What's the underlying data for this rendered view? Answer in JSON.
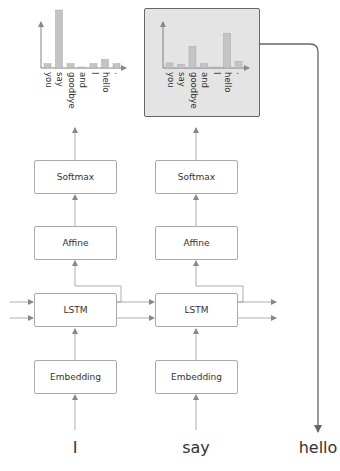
{
  "diagram": {
    "title": "",
    "columns": [
      {
        "input_word": "I",
        "layers": [
          "Embedding",
          "LSTM",
          "Affine",
          "Softmax"
        ],
        "highlighted": false
      },
      {
        "input_word": "say",
        "layers": [
          "Embedding",
          "LSTM",
          "Affine",
          "Softmax"
        ],
        "highlighted": true
      }
    ],
    "sampled_output_word": "hello",
    "layer_labels": {
      "softmax": "Softmax",
      "affine": "Affine",
      "lstm": "LSTM",
      "embedding": "Embedding"
    },
    "words": {
      "col1": "I",
      "col2": "say",
      "output": "hello"
    },
    "colors": {
      "bar": "#c4c4c4",
      "bar_border": "#a8a8a8",
      "highlight_bg": "#e4e4e4",
      "highlight_border": "#666666",
      "line": "#888888"
    }
  },
  "chart_data": [
    {
      "type": "bar",
      "title": "",
      "categories": [
        "you",
        "say",
        "goodbye",
        "and",
        "I",
        "hello",
        "."
      ],
      "values": [
        0.06,
        0.8,
        0.06,
        0.01,
        0.06,
        0.12,
        0.06
      ],
      "xlabel": "",
      "ylabel": "",
      "ylim": [
        0,
        1
      ],
      "orientation": "vertical",
      "label_rotation": 90
    },
    {
      "type": "bar",
      "title": "",
      "categories": [
        "you",
        "say",
        "goodbye",
        "and",
        "I",
        "hello",
        "."
      ],
      "values": [
        0.07,
        0.05,
        0.3,
        0.06,
        0.01,
        0.48,
        0.09
      ],
      "xlabel": "",
      "ylabel": "",
      "ylim": [
        0,
        1
      ],
      "orientation": "vertical",
      "label_rotation": 90,
      "highlighted": true
    }
  ]
}
